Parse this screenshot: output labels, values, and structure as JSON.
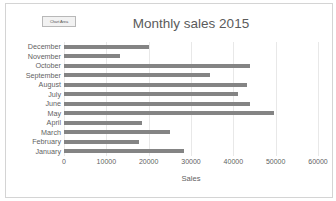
{
  "chart_area_tooltip": "Chart Area",
  "chart_data": {
    "type": "bar",
    "orientation": "horizontal",
    "title": "Monthly sales 2015",
    "xlabel": "Sales",
    "ylabel": "",
    "grid": true,
    "legend": "none",
    "xlim": [
      0,
      60000
    ],
    "xticks": [
      0,
      10000,
      20000,
      30000,
      40000,
      50000,
      60000
    ],
    "xtick_labels": [
      "0",
      "10000",
      "20000",
      "30000",
      "40000",
      "50000",
      "60000"
    ],
    "bar_color": "#848484",
    "categories": [
      "December",
      "November",
      "October",
      "September",
      "August",
      "July",
      "June",
      "May",
      "April",
      "March",
      "February",
      "January"
    ],
    "values": [
      20000,
      13300,
      44000,
      34500,
      43200,
      41000,
      44000,
      49500,
      18500,
      25000,
      17700,
      28300
    ]
  }
}
